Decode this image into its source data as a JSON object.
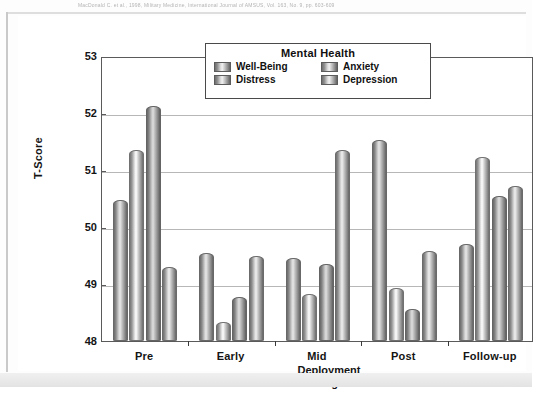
{
  "page": {
    "citation_text": "MacDonald C. et al., 1998, Military Medicine, International Journal of AMSUS, Vol. 163, No. 9, pp. 603-609"
  },
  "chart_data": {
    "type": "bar",
    "title": "",
    "legend_title": "Mental Health",
    "legend_position": "top-center-inside",
    "grid": true,
    "xlabel": "Deployment Stage",
    "ylabel": "T-Score",
    "ylim": [
      48,
      53
    ],
    "yticks": [
      48,
      49,
      50,
      51,
      52,
      53
    ],
    "ytick_labels": [
      "48",
      "49",
      "50",
      "51",
      "52",
      "53"
    ],
    "categories": [
      "Pre",
      "Early",
      "Mid",
      "Post",
      "Follow-up"
    ],
    "series": [
      {
        "name": "Well-Being",
        "values": [
          50.47,
          49.55,
          49.45,
          51.52,
          49.7
        ]
      },
      {
        "name": "Distress",
        "values": [
          51.35,
          48.33,
          48.82,
          48.93,
          51.22
        ]
      },
      {
        "name": "Anxiety",
        "values": [
          52.12,
          48.77,
          49.35,
          48.57,
          50.55
        ]
      },
      {
        "name": "Depression",
        "values": [
          49.3,
          49.5,
          51.35,
          49.58,
          50.72
        ]
      }
    ]
  },
  "colors": {
    "bar_light": "#f0f0f0",
    "bar_mid": "#b9b9b9",
    "bar_dark": "#666666",
    "axis": "#5a5a5a",
    "grid": "#b7b7b7",
    "text": "#141414",
    "plot_background": "#ffffff"
  }
}
